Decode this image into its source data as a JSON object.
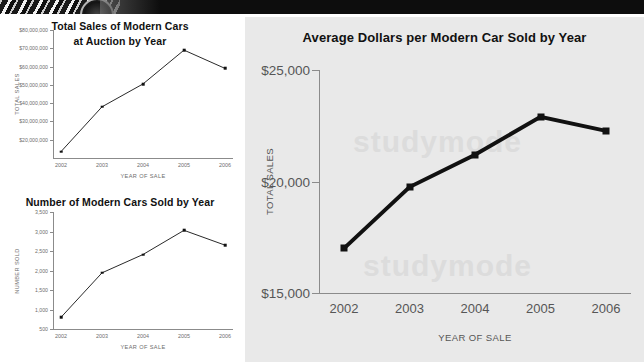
{
  "decoration": {
    "top_band_icon": "car-wheel-image"
  },
  "watermark": {
    "line1": "studymode",
    "line2": "studymode"
  },
  "charts": [
    {
      "id": "chart1",
      "title_line1": "Total Sales of Modern Cars",
      "title_line2": "at Auction by Year",
      "xlabel": "YEAR OF SALE",
      "ylabel": "TOTAL SALES",
      "yticks": [
        "$20,000,000",
        "$30,000,000",
        "$40,000,000",
        "$50,000,000",
        "$60,000,000",
        "$70,000,000",
        "$80,000,000"
      ],
      "xticks": [
        "2002",
        "2003",
        "2004",
        "2005",
        "2006"
      ]
    },
    {
      "id": "chart2",
      "title_line1": "Number of Modern Cars Sold by Year",
      "title_line2": "",
      "xlabel": "YEAR OF SALE",
      "ylabel": "NUMBER SOLD",
      "yticks": [
        "500",
        "1,000",
        "1,500",
        "2,000",
        "2,500",
        "3,000",
        "3,500"
      ],
      "xticks": [
        "2002",
        "2003",
        "2004",
        "2005",
        "2006"
      ]
    },
    {
      "id": "chart3",
      "title_line1": "Average Dollars per Modern Car Sold by Year",
      "title_line2": "",
      "xlabel": "YEAR OF SALE",
      "ylabel": "TOTAL SALES",
      "yticks": [
        "$15,000",
        "$20,000",
        "$25,000"
      ],
      "xticks": [
        "2002",
        "2003",
        "2004",
        "2005",
        "2006"
      ]
    }
  ],
  "chart_data": [
    {
      "type": "line",
      "title": "Total Sales of Modern Cars at Auction by Year",
      "xlabel": "YEAR OF SALE",
      "ylabel": "TOTAL SALES",
      "categories": [
        "2002",
        "2003",
        "2004",
        "2005",
        "2006"
      ],
      "values": [
        13500000,
        38000000,
        50500000,
        69000000,
        59000000
      ],
      "ytick_values": [
        20000000,
        30000000,
        40000000,
        50000000,
        60000000,
        70000000,
        80000000
      ],
      "ylim": [
        10000000,
        80000000
      ],
      "grid": false,
      "legend": "none",
      "marker": "square",
      "line_color": "#111111"
    },
    {
      "type": "line",
      "title": "Number of Modern Cars Sold by Year",
      "xlabel": "YEAR OF SALE",
      "ylabel": "NUMBER SOLD",
      "categories": [
        "2002",
        "2003",
        "2004",
        "2005",
        "2006"
      ],
      "values": [
        800,
        1940,
        2410,
        3030,
        2650
      ],
      "ytick_values": [
        500,
        1000,
        1500,
        2000,
        2500,
        3000,
        3500
      ],
      "ylim": [
        500,
        3500
      ],
      "grid": false,
      "legend": "none",
      "marker": "square",
      "line_color": "#111111"
    },
    {
      "type": "line",
      "title": "Average Dollars per Modern Car Sold by Year",
      "xlabel": "YEAR OF SALE",
      "ylabel": "TOTAL SALES",
      "categories": [
        "2002",
        "2003",
        "2004",
        "2005",
        "2006"
      ],
      "values": [
        17000,
        19750,
        21200,
        22900,
        22270
      ],
      "ytick_values": [
        15000,
        20000,
        25000
      ],
      "ylim": [
        15000,
        25000
      ],
      "grid": false,
      "legend": "none",
      "marker": "square",
      "line_color": "#111111"
    }
  ]
}
